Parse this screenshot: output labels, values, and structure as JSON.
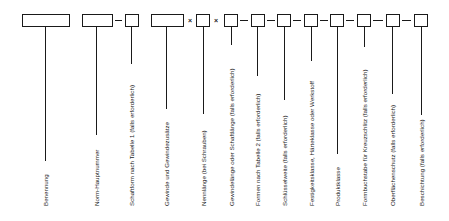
{
  "diagram": {
    "type": "designation-scheme",
    "language": "de",
    "separators": {
      "dash": "–",
      "times": "×"
    },
    "fields": [
      {
        "id": "benennung",
        "label": "Benennung"
      },
      {
        "id": "norm-hauptnummer",
        "label": "Norm-Hauptnummer"
      },
      {
        "id": "schaftform",
        "label": "Schaftform nach Tabelle 1 (falls erforderlich)"
      },
      {
        "id": "gewinde",
        "label": "Gewinde und Gewindezusätze"
      },
      {
        "id": "nennlaenge",
        "label": "Nennlänge (bei Schrauben)"
      },
      {
        "id": "gewindelaenge",
        "label": "Gewindelänge oder Schaftlänge (falls erforderlich)"
      },
      {
        "id": "formen",
        "label": "Formen nach Tabelle 2 (falls erforderlich)"
      },
      {
        "id": "schluesselweite",
        "label": "Schlüsselweite (falls erforderlich)"
      },
      {
        "id": "festigkeitsklasse",
        "label": "Festigkeitsklasse, Härteklasse oder Werkstoff"
      },
      {
        "id": "produktklasse",
        "label": "Produktklasse"
      },
      {
        "id": "formbuchstabe",
        "label": "Formbuchstabe für Kreuzschlitz (falls erforderlich)"
      },
      {
        "id": "oberflaechenschutz",
        "label": "Oberflächenschutz (falls erforderlich)"
      },
      {
        "id": "beschichtung",
        "label": "Beschichtung (falls erforderlich)"
      }
    ]
  }
}
